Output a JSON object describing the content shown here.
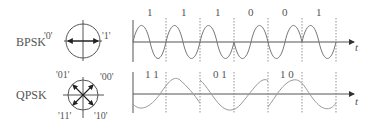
{
  "bpsk": {
    "name": "BPSK",
    "constellation": {
      "left_label": "'0'",
      "right_label": "'1'"
    },
    "bits": [
      "1",
      "1",
      "1",
      "0",
      "0",
      "1"
    ],
    "axis_label": "t"
  },
  "qpsk": {
    "name": "QPSK",
    "constellation": {
      "tl_label": "'01'",
      "tr_label": "'00'",
      "bl_label": "'11'",
      "br_label": "'10'"
    },
    "symbols": [
      "1 1",
      "0 1",
      "1 0"
    ],
    "axis_label": "t"
  },
  "colors": {
    "wave": "#777777",
    "axis": "#555555",
    "dash": "#777777",
    "text": "#555555"
  }
}
